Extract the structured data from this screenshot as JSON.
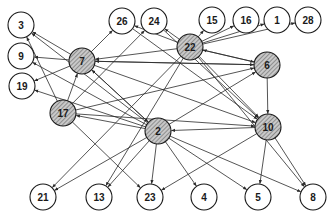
{
  "diagram": {
    "type": "directed-graph",
    "colors": {
      "edge": "#2a2a2a",
      "node_border": "#1a1a1a",
      "plain_fill": "#ffffff",
      "hatch_fill": "#c8c8c8",
      "hatch_line": "#555555"
    },
    "node_radius": 13,
    "nodes": [
      {
        "id": "3",
        "label": "3",
        "x": 21,
        "y": 25,
        "hatched": false
      },
      {
        "id": "26",
        "label": "26",
        "x": 122,
        "y": 21,
        "hatched": false
      },
      {
        "id": "24",
        "label": "24",
        "x": 154,
        "y": 21,
        "hatched": false
      },
      {
        "id": "15",
        "label": "15",
        "x": 212,
        "y": 20,
        "hatched": false
      },
      {
        "id": "16",
        "label": "16",
        "x": 246,
        "y": 20,
        "hatched": false
      },
      {
        "id": "1",
        "label": "1",
        "x": 277,
        "y": 20,
        "hatched": false
      },
      {
        "id": "28",
        "label": "28",
        "x": 308,
        "y": 20,
        "hatched": false
      },
      {
        "id": "9",
        "label": "9",
        "x": 21,
        "y": 56,
        "hatched": false
      },
      {
        "id": "7",
        "label": "7",
        "x": 82,
        "y": 61,
        "hatched": true
      },
      {
        "id": "22",
        "label": "22",
        "x": 190,
        "y": 47,
        "hatched": true
      },
      {
        "id": "6",
        "label": "6",
        "x": 267,
        "y": 65,
        "hatched": true
      },
      {
        "id": "19",
        "label": "19",
        "x": 22,
        "y": 86,
        "hatched": false
      },
      {
        "id": "17",
        "label": "17",
        "x": 63,
        "y": 113,
        "hatched": true
      },
      {
        "id": "2",
        "label": "2",
        "x": 158,
        "y": 131,
        "hatched": true
      },
      {
        "id": "10",
        "label": "10",
        "x": 268,
        "y": 127,
        "hatched": true
      },
      {
        "id": "21",
        "label": "21",
        "x": 43,
        "y": 197,
        "hatched": false
      },
      {
        "id": "13",
        "label": "13",
        "x": 99,
        "y": 197,
        "hatched": false
      },
      {
        "id": "23",
        "label": "23",
        "x": 150,
        "y": 197,
        "hatched": false
      },
      {
        "id": "4",
        "label": "4",
        "x": 204,
        "y": 197,
        "hatched": false
      },
      {
        "id": "5",
        "label": "5",
        "x": 258,
        "y": 197,
        "hatched": false
      },
      {
        "id": "8",
        "label": "8",
        "x": 313,
        "y": 197,
        "hatched": false
      }
    ],
    "edges": [
      {
        "from": "7",
        "to": "3"
      },
      {
        "from": "7",
        "to": "9"
      },
      {
        "from": "7",
        "to": "19"
      },
      {
        "from": "7",
        "to": "26"
      },
      {
        "from": "7",
        "to": "6"
      },
      {
        "from": "7",
        "to": "10"
      },
      {
        "from": "7",
        "to": "2"
      },
      {
        "from": "22",
        "to": "7"
      },
      {
        "from": "22",
        "to": "15"
      },
      {
        "from": "22",
        "to": "16"
      },
      {
        "from": "22",
        "to": "1"
      },
      {
        "from": "22",
        "to": "28"
      },
      {
        "from": "22",
        "to": "24"
      },
      {
        "from": "22",
        "to": "26"
      },
      {
        "from": "22",
        "to": "6"
      },
      {
        "from": "22",
        "to": "10"
      },
      {
        "from": "22",
        "to": "13"
      },
      {
        "from": "22",
        "to": "21"
      },
      {
        "from": "22",
        "to": "8"
      },
      {
        "from": "6",
        "to": "7"
      },
      {
        "from": "6",
        "to": "22"
      },
      {
        "from": "6",
        "to": "10"
      },
      {
        "from": "17",
        "to": "7"
      },
      {
        "from": "17",
        "to": "3"
      },
      {
        "from": "17",
        "to": "6"
      },
      {
        "from": "17",
        "to": "10"
      },
      {
        "from": "17",
        "to": "23"
      },
      {
        "from": "17",
        "to": "24"
      },
      {
        "from": "2",
        "to": "17"
      },
      {
        "from": "2",
        "to": "3"
      },
      {
        "from": "2",
        "to": "9"
      },
      {
        "from": "2",
        "to": "19"
      },
      {
        "from": "2",
        "to": "7"
      },
      {
        "from": "2",
        "to": "6"
      },
      {
        "from": "2",
        "to": "21"
      },
      {
        "from": "2",
        "to": "13"
      },
      {
        "from": "2",
        "to": "23"
      },
      {
        "from": "2",
        "to": "4"
      },
      {
        "from": "2",
        "to": "5"
      },
      {
        "from": "2",
        "to": "8"
      },
      {
        "from": "10",
        "to": "2"
      },
      {
        "from": "10",
        "to": "23"
      },
      {
        "from": "10",
        "to": "5"
      },
      {
        "from": "10",
        "to": "8"
      },
      {
        "from": "26",
        "to": "10"
      },
      {
        "from": "24",
        "to": "10"
      }
    ]
  }
}
